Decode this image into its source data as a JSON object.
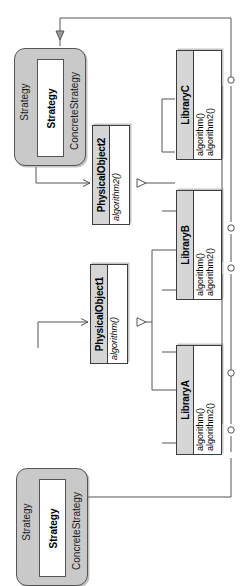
{
  "diagram": {
    "kind": "uml-class-diagram",
    "orientation": "rotated-90",
    "background_color": "#ffffff",
    "line_color": "#555555",
    "header_fill": "#d6d6d6",
    "package_fill": "#c9c9c9"
  },
  "packages": [
    {
      "id": "strategy-package-top",
      "name": "Strategy",
      "inner_class": "Strategy",
      "subtitle": "ConcreteStrategy"
    },
    {
      "id": "strategy-package-bottom",
      "name": "Strategy",
      "inner_class": "Strategy",
      "subtitle": "ConcreteStrategy"
    }
  ],
  "classes": [
    {
      "id": "physical-object-2",
      "name": "PhysicalObject2",
      "operations": [
        "algorithm2()"
      ],
      "abstract_operations": true
    },
    {
      "id": "physical-object-1",
      "name": "PhysicalObject1",
      "operations": [
        "algorithm()"
      ],
      "abstract_operations": true
    },
    {
      "id": "library-c",
      "name": "LibraryC",
      "operations": [
        "algorithm()",
        "algorithm2()"
      ],
      "abstract_operations": false
    },
    {
      "id": "library-b",
      "name": "LibraryB",
      "operations": [
        "algorithm()",
        "algorithm2()"
      ],
      "abstract_operations": false
    },
    {
      "id": "library-a",
      "name": "LibraryA",
      "operations": [
        "algorithm()",
        "algorithm2()"
      ],
      "abstract_operations": false
    }
  ],
  "connectors": [
    {
      "id": "gen-libc-to-po2",
      "type": "generalization",
      "from": "LibraryC",
      "to": "PhysicalObject2"
    },
    {
      "id": "gen-liba-to-po1",
      "type": "generalization",
      "from": "LibraryA",
      "to": "PhysicalObject1"
    },
    {
      "id": "gen-libb-to-po1",
      "type": "generalization",
      "from": "LibraryB",
      "to": "PhysicalObject1"
    },
    {
      "id": "realize-to-strategy-top",
      "type": "realization",
      "from": "LibraryC",
      "to": "Strategy"
    },
    {
      "id": "realize-to-strategy-bottom",
      "type": "realization",
      "from": "LibraryA",
      "to": "Strategy"
    },
    {
      "id": "assoc-strategy-top-to-po2",
      "type": "association",
      "from": "Strategy",
      "to": "PhysicalObject2"
    },
    {
      "id": "assoc-strategy-bottom-to-po1",
      "type": "association",
      "from": "Strategy",
      "to": "PhysicalObject1"
    },
    {
      "id": "dep-libc-algorithm",
      "type": "dependency",
      "from": "LibraryC",
      "to": "algorithm()"
    },
    {
      "id": "dep-libc-algorithm2",
      "type": "dependency",
      "from": "LibraryC",
      "to": "algorithm2()"
    },
    {
      "id": "dep-libb-algorithm",
      "type": "dependency",
      "from": "LibraryB",
      "to": "algorithm()"
    },
    {
      "id": "dep-libb-algorithm2",
      "type": "dependency",
      "from": "LibraryB",
      "to": "algorithm2()"
    },
    {
      "id": "dep-liba-algorithm",
      "type": "dependency",
      "from": "LibraryA",
      "to": "algorithm()"
    },
    {
      "id": "dep-liba-algorithm2",
      "type": "dependency",
      "from": "LibraryA",
      "to": "algorithm2()"
    }
  ]
}
